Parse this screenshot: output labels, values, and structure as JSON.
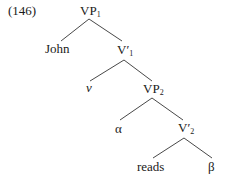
{
  "example_number": "(146)",
  "nodes": {
    "vp1": {
      "text": "VP",
      "sub": "1"
    },
    "john": {
      "text": "John"
    },
    "vbar1": {
      "text": "V′",
      "sub": "1"
    },
    "v": {
      "text": "v"
    },
    "vp2": {
      "text": "VP",
      "sub": "2"
    },
    "alpha": {
      "text": "α"
    },
    "vbar2": {
      "text": "V′",
      "sub": "2"
    },
    "reads": {
      "text": "reads"
    },
    "beta": {
      "text": "β"
    }
  },
  "colors": {
    "line": "#333333",
    "text": "#1a1a1a"
  }
}
